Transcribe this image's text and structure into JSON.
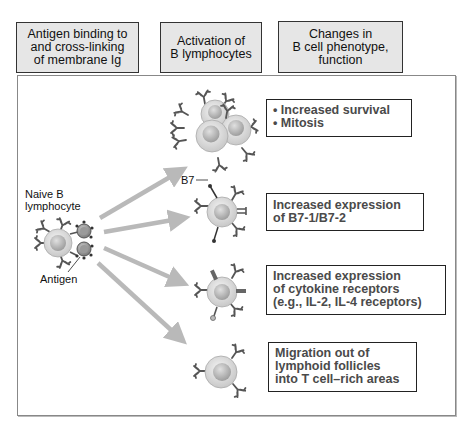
{
  "headers": [
    {
      "lines": [
        "Antigen binding to",
        "and cross-linking",
        "of membrane Ig"
      ]
    },
    {
      "lines": [
        "Activation of",
        "B lymphocytes"
      ]
    },
    {
      "lines": [
        "Changes in",
        "B cell phenotype,",
        "function"
      ]
    }
  ],
  "labels": {
    "naive_b": [
      "Naive B",
      "lymphocyte"
    ],
    "antigen": "Antigen",
    "b7": "B7"
  },
  "outcomes": [
    {
      "lines": [
        "• Increased survival",
        "• Mitosis"
      ]
    },
    {
      "lines": [
        "Increased expression",
        "of B7-1/B7-2"
      ]
    },
    {
      "lines": [
        "Increased expression",
        "of cytokine receptors",
        "(e.g., IL-2, IL-4 receptors)"
      ]
    },
    {
      "lines": [
        "Migration out of",
        "lymphoid follicles",
        "into T cell–rich areas"
      ]
    }
  ],
  "colors": {
    "header_fill": "#e6e6e6",
    "arrow": "#b9b9b9",
    "cell_outer": "#d8d8d8",
    "cell_nucleus": "#bdbdbd",
    "receptor": "#555555",
    "outcome_text": "#4a4a4a"
  }
}
